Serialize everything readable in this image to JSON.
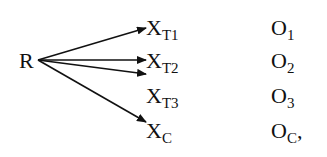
{
  "diagram": {
    "source": {
      "label": "R"
    },
    "groups": [
      {
        "main": "X",
        "sub": "T1",
        "obs_main": "O",
        "obs_sub": "1",
        "obs_suffix": ""
      },
      {
        "main": "X",
        "sub": "T2",
        "obs_main": "O",
        "obs_sub": "2",
        "obs_suffix": ""
      },
      {
        "main": "X",
        "sub": "T3",
        "obs_main": "O",
        "obs_sub": "3",
        "obs_suffix": ""
      },
      {
        "main": "X",
        "sub": "C",
        "obs_main": "O",
        "obs_sub": "C",
        "obs_suffix": ","
      }
    ],
    "colors": {
      "ink": "#111111",
      "background": "#ffffff"
    }
  }
}
